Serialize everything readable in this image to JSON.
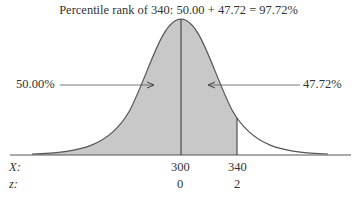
{
  "title": "Percentile rank of 340: 50.00 + 47.72 = 97.72%",
  "left_area_label": "50.00%",
  "right_area_label": "47.72%",
  "axis": {
    "x_label": "X:",
    "z_label": "z:",
    "x_ticks": [
      "300",
      "340"
    ],
    "z_ticks": [
      "0",
      "2"
    ]
  },
  "colors": {
    "shade": "#c8c8c8",
    "line": "#555555"
  }
}
